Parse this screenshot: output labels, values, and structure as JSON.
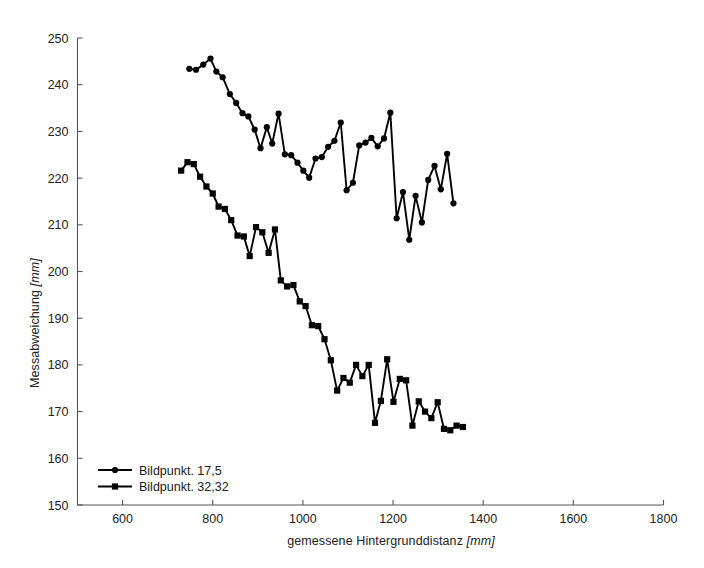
{
  "chart_data": {
    "type": "line",
    "title": "",
    "xlabel": "gemessene Hintergrunddistanz [mm]",
    "xlabel_main": "gemessene Hintergrunddistanz",
    "xlabel_unit": "[mm]",
    "ylabel": "Messabweichung [mm]",
    "ylabel_main": "Messabweichung",
    "ylabel_unit": "[mm]",
    "xlim": [
      500,
      1800
    ],
    "ylim": [
      150,
      250
    ],
    "xticks": [
      600,
      800,
      1000,
      1200,
      1400,
      1600,
      1800
    ],
    "xtick_labels": [
      "600",
      "800",
      "1000",
      "1200",
      "1400",
      "1600",
      "1800"
    ],
    "yticks": [
      150,
      160,
      170,
      180,
      190,
      200,
      210,
      220,
      230,
      240,
      250
    ],
    "ytick_labels": [
      "150",
      "160",
      "170",
      "180",
      "190",
      "200",
      "210",
      "220",
      "230",
      "240",
      "250"
    ],
    "grid": false,
    "legend_position": "lower left",
    "line_color": "#000000",
    "series": [
      {
        "name": "Bildpunkt. 17,5",
        "marker": "circle",
        "color": "#000000",
        "points": [
          [
            748,
            243.4
          ],
          [
            763,
            243.2
          ],
          [
            779,
            244.3
          ],
          [
            795,
            245.6
          ],
          [
            808,
            242.8
          ],
          [
            822,
            241.6
          ],
          [
            838,
            238.0
          ],
          [
            852,
            236.1
          ],
          [
            866,
            233.9
          ],
          [
            879,
            233.2
          ],
          [
            893,
            230.4
          ],
          [
            906,
            226.4
          ],
          [
            920,
            230.9
          ],
          [
            932,
            227.4
          ],
          [
            946,
            233.8
          ],
          [
            960,
            225.1
          ],
          [
            974,
            224.9
          ],
          [
            988,
            223.3
          ],
          [
            1001,
            221.6
          ],
          [
            1014,
            220.1
          ],
          [
            1028,
            224.2
          ],
          [
            1042,
            224.5
          ],
          [
            1056,
            226.7
          ],
          [
            1070,
            228.0
          ],
          [
            1084,
            231.9
          ],
          [
            1097,
            217.4
          ],
          [
            1111,
            219.0
          ],
          [
            1125,
            227.0
          ],
          [
            1139,
            227.6
          ],
          [
            1152,
            228.6
          ],
          [
            1166,
            226.8
          ],
          [
            1180,
            228.5
          ],
          [
            1194,
            234.0
          ],
          [
            1208,
            211.4
          ],
          [
            1222,
            217.0
          ],
          [
            1236,
            206.8
          ],
          [
            1250,
            216.2
          ],
          [
            1264,
            210.5
          ],
          [
            1278,
            219.6
          ],
          [
            1292,
            222.6
          ],
          [
            1306,
            217.6
          ],
          [
            1320,
            225.2
          ],
          [
            1334,
            214.6
          ]
        ]
      },
      {
        "name": "Bildpunkt. 32,32",
        "marker": "square",
        "color": "#000000",
        "points": [
          [
            730,
            221.6
          ],
          [
            744,
            223.4
          ],
          [
            758,
            223.0
          ],
          [
            772,
            220.3
          ],
          [
            786,
            218.2
          ],
          [
            800,
            216.7
          ],
          [
            813,
            213.9
          ],
          [
            827,
            213.4
          ],
          [
            841,
            211.0
          ],
          [
            855,
            207.7
          ],
          [
            869,
            207.5
          ],
          [
            882,
            203.3
          ],
          [
            896,
            209.5
          ],
          [
            910,
            208.4
          ],
          [
            924,
            204.0
          ],
          [
            938,
            209.0
          ],
          [
            951,
            198.1
          ],
          [
            965,
            196.8
          ],
          [
            979,
            197.1
          ],
          [
            993,
            193.6
          ],
          [
            1006,
            192.6
          ],
          [
            1020,
            188.5
          ],
          [
            1034,
            188.3
          ],
          [
            1048,
            185.5
          ],
          [
            1062,
            181.0
          ],
          [
            1076,
            174.5
          ],
          [
            1090,
            177.2
          ],
          [
            1104,
            176.2
          ],
          [
            1118,
            180.0
          ],
          [
            1132,
            177.6
          ],
          [
            1146,
            180.0
          ],
          [
            1160,
            167.6
          ],
          [
            1173,
            172.3
          ],
          [
            1187,
            181.2
          ],
          [
            1201,
            172.1
          ],
          [
            1215,
            177.0
          ],
          [
            1229,
            176.7
          ],
          [
            1243,
            167.0
          ],
          [
            1257,
            172.2
          ],
          [
            1271,
            170.0
          ],
          [
            1285,
            168.6
          ],
          [
            1299,
            172.0
          ],
          [
            1313,
            166.3
          ],
          [
            1327,
            166.0
          ],
          [
            1341,
            167.0
          ],
          [
            1355,
            166.7
          ]
        ]
      }
    ]
  },
  "legend": {
    "entries": [
      {
        "label": "Bildpunkt. 17,5",
        "marker": "circle"
      },
      {
        "label": "Bildpunkt. 32,32",
        "marker": "square"
      }
    ]
  }
}
